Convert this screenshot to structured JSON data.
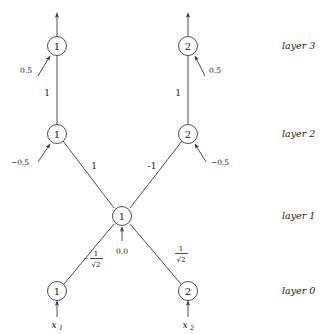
{
  "figure": {
    "kind": "neural-network-diagram",
    "background_color": "#ffffff",
    "line_color": "#3a3a3a",
    "text_color": "#1a1a1a"
  },
  "layer_labels": [
    {
      "text": "layer 3",
      "y": 45
    },
    {
      "text": "layer 2",
      "y": 134
    },
    {
      "text": "layer 1",
      "y": 216
    },
    {
      "text": "layer 0",
      "y": 291
    }
  ],
  "nodes": [
    {
      "id": "l3n1",
      "label": "1",
      "layer": "layer 3",
      "x": 57,
      "y": 46
    },
    {
      "id": "l3n2",
      "label": "2",
      "layer": "layer 3",
      "x": 188,
      "y": 46
    },
    {
      "id": "l2n1",
      "label": "1",
      "layer": "layer 2",
      "x": 57,
      "y": 134
    },
    {
      "id": "l2n2",
      "label": "2",
      "layer": "layer 2",
      "x": 188,
      "y": 134
    },
    {
      "id": "l1n1",
      "label": "1",
      "layer": "layer 1",
      "x": 122,
      "y": 216
    },
    {
      "id": "l0n1",
      "label": "1",
      "layer": "layer 0",
      "x": 57,
      "y": 291
    },
    {
      "id": "l0n2",
      "label": "2",
      "layer": "layer 0",
      "x": 188,
      "y": 291
    }
  ],
  "edges": [
    {
      "from": "l2n1",
      "to": "l3n1",
      "weight_label": "1",
      "label_x": 47,
      "label_y": 93
    },
    {
      "from": "l2n2",
      "to": "l3n2",
      "weight_label": "1",
      "label_x": 178,
      "label_y": 93
    },
    {
      "from": "l1n1",
      "to": "l2n1",
      "weight_label": "1",
      "label_x": 94,
      "label_y": 166
    },
    {
      "from": "l1n1",
      "to": "l2n2",
      "weight_label": "-1",
      "label_x": 152,
      "label_y": 166
    },
    {
      "from": "l0n1",
      "to": "l1n1",
      "weight_label": "-1/√2",
      "label_x": 97,
      "label_y": 260
    },
    {
      "from": "l0n2",
      "to": "l1n1",
      "weight_label": "1/√2",
      "label_x": 181,
      "label_y": 255
    }
  ],
  "fraction_labels": [
    {
      "id": "frac-left",
      "sign": "−",
      "numerator": "1",
      "denominator": "√2",
      "x": 94,
      "y": 260
    },
    {
      "id": "frac-right",
      "sign": "",
      "numerator": "1",
      "denominator": "√2",
      "x": 181,
      "y": 255
    }
  ],
  "biases": [
    {
      "node": "l3n1",
      "value": "0.5",
      "label_x": 26,
      "label_y": 70
    },
    {
      "node": "l3n2",
      "value": "0.5",
      "label_x": 206,
      "label_y": 70
    },
    {
      "node": "l2n1",
      "value": "−0.5",
      "label_x": 14,
      "label_y": 156
    },
    {
      "node": "l2n2",
      "value": "−0.5",
      "label_x": 208,
      "label_y": 156
    },
    {
      "node": "l1n1",
      "value": "0.0",
      "label_x": 122,
      "label_y": 250
    }
  ],
  "inputs": [
    {
      "node": "l0n1",
      "name": "x",
      "subscript": "1",
      "x": 57,
      "y": 325
    },
    {
      "node": "l0n2",
      "name": "x",
      "subscript": "2",
      "x": 188,
      "y": 325
    }
  ],
  "outputs": [
    {
      "node": "l3n1",
      "x": 57,
      "tip_y": 11
    },
    {
      "node": "l3n2",
      "x": 188,
      "tip_y": 11
    }
  ]
}
